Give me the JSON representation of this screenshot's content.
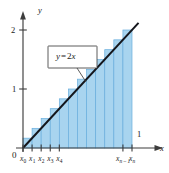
{
  "figure": {
    "name": "riemann-sum-rectangles-under-line",
    "background_color": "#ffffff",
    "width": 169,
    "height": 173
  },
  "axes": {
    "x_axis_label": "x",
    "y_axis_label": "y",
    "origin_label": "0",
    "axis_color": "#3d3d3d",
    "y_ticks": [
      {
        "label": "1",
        "value": 1
      },
      {
        "label": "2",
        "value": 2
      }
    ],
    "x_ticks": [
      {
        "label": "x",
        "sub": "0",
        "sub_italic": false
      },
      {
        "label": "x",
        "sub": "1",
        "sub_italic": false
      },
      {
        "label": "x",
        "sub": "2",
        "sub_italic": false
      },
      {
        "label": "x",
        "sub": "3",
        "sub_italic": false
      },
      {
        "label": "x",
        "sub": "4",
        "sub_italic": false
      },
      {
        "label": "x",
        "sub": "n – 1",
        "sub_italic": true
      },
      {
        "label": "x",
        "sub": "n",
        "sub_italic": true
      }
    ],
    "x_endpoint_label": "1"
  },
  "callout": {
    "text_var": "y",
    "text_op": "=",
    "text_coef": "2",
    "text_arg": "x",
    "full_text": "y = 2x",
    "box_fill": "#ffffff",
    "box_stroke": "#4a4a4a"
  },
  "chart_data": {
    "type": "bar",
    "title": "",
    "xlabel": "x",
    "ylabel": "y",
    "xlim": [
      0,
      1.12
    ],
    "ylim": [
      0,
      2.3
    ],
    "grid": false,
    "legend": null,
    "function": {
      "expression": "y = 2x",
      "slope": 2,
      "intercept": 0,
      "color": "#14161c",
      "x_start": 0,
      "x_end": 1.06
    },
    "rectangles": {
      "count": 12,
      "rule": "right-endpoint circumscribed",
      "interval": [
        0,
        1
      ],
      "width": 0.08333,
      "fill_color": "#a8d4ef",
      "edge_color": "#6aaedd",
      "x_left": [
        0,
        0.08333,
        0.16667,
        0.25,
        0.33333,
        0.41667,
        0.5,
        0.58333,
        0.66667,
        0.75,
        0.83333,
        0.91667
      ],
      "x_right": [
        0.08333,
        0.16667,
        0.25,
        0.33333,
        0.41667,
        0.5,
        0.58333,
        0.66667,
        0.75,
        0.83333,
        0.91667,
        1.0
      ],
      "heights": [
        0.16667,
        0.33333,
        0.5,
        0.66667,
        0.83333,
        1.0,
        1.16667,
        1.33333,
        1.5,
        1.66667,
        1.83333,
        2.0
      ]
    },
    "annotations": [
      {
        "text": "y = 2x",
        "type": "callout-box",
        "points_to_curve": true
      }
    ]
  }
}
